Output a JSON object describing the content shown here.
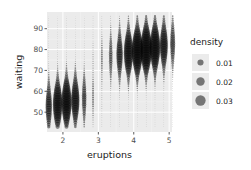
{
  "chart_data": {
    "type": "scatter",
    "subtype": "2d-density-grid-points",
    "title": "",
    "xlabel": "eruptions",
    "ylabel": "waiting",
    "xlim": [
      1.55,
      5.08
    ],
    "ylim": [
      40.5,
      98
    ],
    "x_ticks": [
      2,
      3,
      4,
      5
    ],
    "x_tick_labels": [
      "2",
      "3",
      "4",
      "5"
    ],
    "y_ticks": [
      50,
      60,
      70,
      80,
      90
    ],
    "y_tick_labels": [
      "50",
      "60",
      "70",
      "80",
      "90"
    ],
    "grid": true,
    "grid_x": {
      "from": 1.6,
      "to": 5.1,
      "n": 15
    },
    "grid_y": {
      "from": 43,
      "to": 96,
      "n": 50
    },
    "density_model": {
      "components": [
        {
          "weight": 0.35,
          "mean_x": 2.04,
          "mean_y": 54.5,
          "sd_x": 0.3,
          "sd_y": 5.9,
          "rho": 0.2
        },
        {
          "weight": 0.65,
          "mean_x": 4.29,
          "mean_y": 80.0,
          "sd_x": 0.42,
          "sd_y": 5.9,
          "rho": 0.25
        }
      ]
    },
    "point_color": "#000000",
    "point_alpha": 0.45,
    "size_range_px": [
      0.2,
      5.6
    ],
    "legend": {
      "title": "density",
      "position": "right",
      "entries": [
        {
          "label": "0.01",
          "value": 0.01
        },
        {
          "label": "0.02",
          "value": 0.02
        },
        {
          "label": "0.03",
          "value": 0.03
        }
      ]
    }
  },
  "colors": {
    "panel_background": "#ebebeb",
    "grid_major": "#ffffff",
    "legend_key_background": "#ebebeb",
    "point": "#000000"
  }
}
